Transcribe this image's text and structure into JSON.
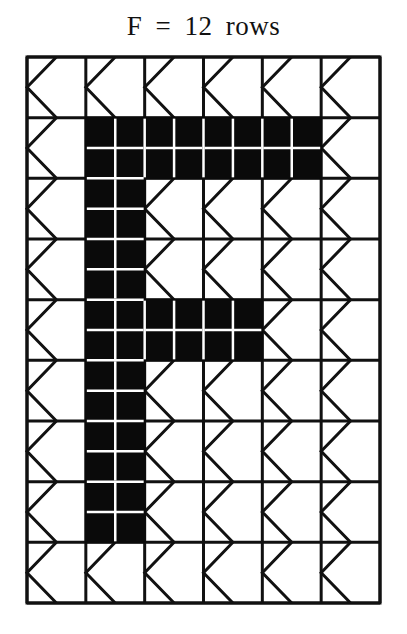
{
  "title": "F = 12 rows",
  "grid": {
    "columns": 6,
    "rows": 9,
    "origin_x": 27,
    "origin_y": 57,
    "width": 353,
    "height": 546,
    "line_color": "#111111",
    "fill_color": "#0a0a0a",
    "background": "#ffffff",
    "filled_cells": [
      [
        1,
        1
      ],
      [
        1,
        2
      ],
      [
        1,
        3
      ],
      [
        1,
        4
      ],
      [
        2,
        1
      ],
      [
        3,
        1
      ],
      [
        4,
        1
      ],
      [
        4,
        2
      ],
      [
        4,
        3
      ],
      [
        5,
        1
      ],
      [
        6,
        1
      ],
      [
        7,
        1
      ]
    ],
    "cell_motif": "chevron-left"
  },
  "letter": "F"
}
